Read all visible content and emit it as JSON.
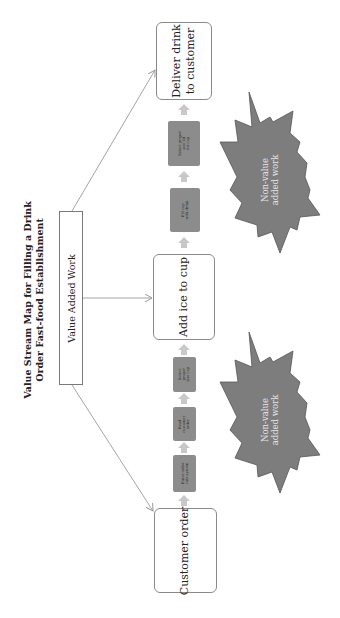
{
  "diagram": {
    "title_line1": "Value Stream Map for Filling a Drink",
    "title_line2": "Order Fast-food Establishment",
    "value_added_label": "Value Added Work",
    "main_steps": [
      {
        "label_line1": "Customer order",
        "label_line2": ""
      },
      {
        "label_line1": "Add ice to cup",
        "label_line2": ""
      },
      {
        "label_line1": "Deliver drink",
        "label_line2": "to customer"
      }
    ],
    "sub_steps": [
      {
        "line1": "Enter order",
        "line2": "into system",
        "line3": ""
      },
      {
        "line1": "Read",
        "line2": "customer",
        "line3": "order"
      },
      {
        "line1": "Select",
        "line2": "proper",
        "line3": "size cup"
      },
      {
        "line1": "Fill cup",
        "line2": "with drink",
        "line3": ""
      },
      {
        "line1": "Select proper",
        "line2": "size lid",
        "line3": "for cup"
      }
    ],
    "non_value_labels": [
      {
        "line1": "Non-value",
        "line2": "added work"
      },
      {
        "line1": "Non-value",
        "line2": "added work"
      }
    ],
    "colors": {
      "box_border": "#8a8a8a",
      "gray_step": "#8c8c8c",
      "star_fill": "#7d7d7d",
      "star_stroke": "#555555",
      "arrow": "#c8c8c8",
      "connector": "#9a9a9a"
    }
  }
}
